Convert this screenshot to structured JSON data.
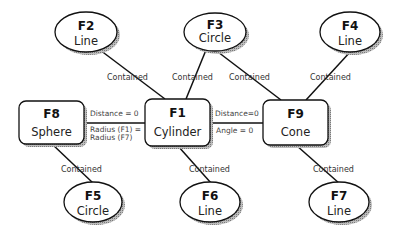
{
  "diagram": {
    "nodes": [
      {
        "id": "F1",
        "type": "Cylinder",
        "shape": "box"
      },
      {
        "id": "F2",
        "type": "Line",
        "shape": "ellipse"
      },
      {
        "id": "F3",
        "type": "Circle",
        "shape": "ellipse"
      },
      {
        "id": "F4",
        "type": "Line",
        "shape": "ellipse"
      },
      {
        "id": "F5",
        "type": "Circle",
        "shape": "ellipse"
      },
      {
        "id": "F6",
        "type": "Line",
        "shape": "ellipse"
      },
      {
        "id": "F7",
        "type": "Line",
        "shape": "ellipse"
      },
      {
        "id": "F8",
        "type": "Sphere",
        "shape": "box"
      },
      {
        "id": "F9",
        "type": "Cone",
        "shape": "box"
      }
    ],
    "edges": [
      {
        "from": "F2",
        "to": "F1",
        "label": "Contained"
      },
      {
        "from": "F3",
        "to": "F1",
        "label": "Contained"
      },
      {
        "from": "F3",
        "to": "F9",
        "label": "Contained"
      },
      {
        "from": "F4",
        "to": "F9",
        "label": "Contained"
      },
      {
        "from": "F8",
        "to": "F5",
        "label": "Contained"
      },
      {
        "from": "F1",
        "to": "F6",
        "label": "Contained"
      },
      {
        "from": "F9",
        "to": "F7",
        "label": "Contained"
      },
      {
        "from": "F8",
        "to": "F1",
        "label_top": "Distance = 0",
        "label_bottom_1": "Radius (F1) =",
        "label_bottom_2": "Radius (F7)"
      },
      {
        "from": "F1",
        "to": "F9",
        "label_top": "Distance=0",
        "label_bottom": "Angle = 0"
      }
    ]
  }
}
